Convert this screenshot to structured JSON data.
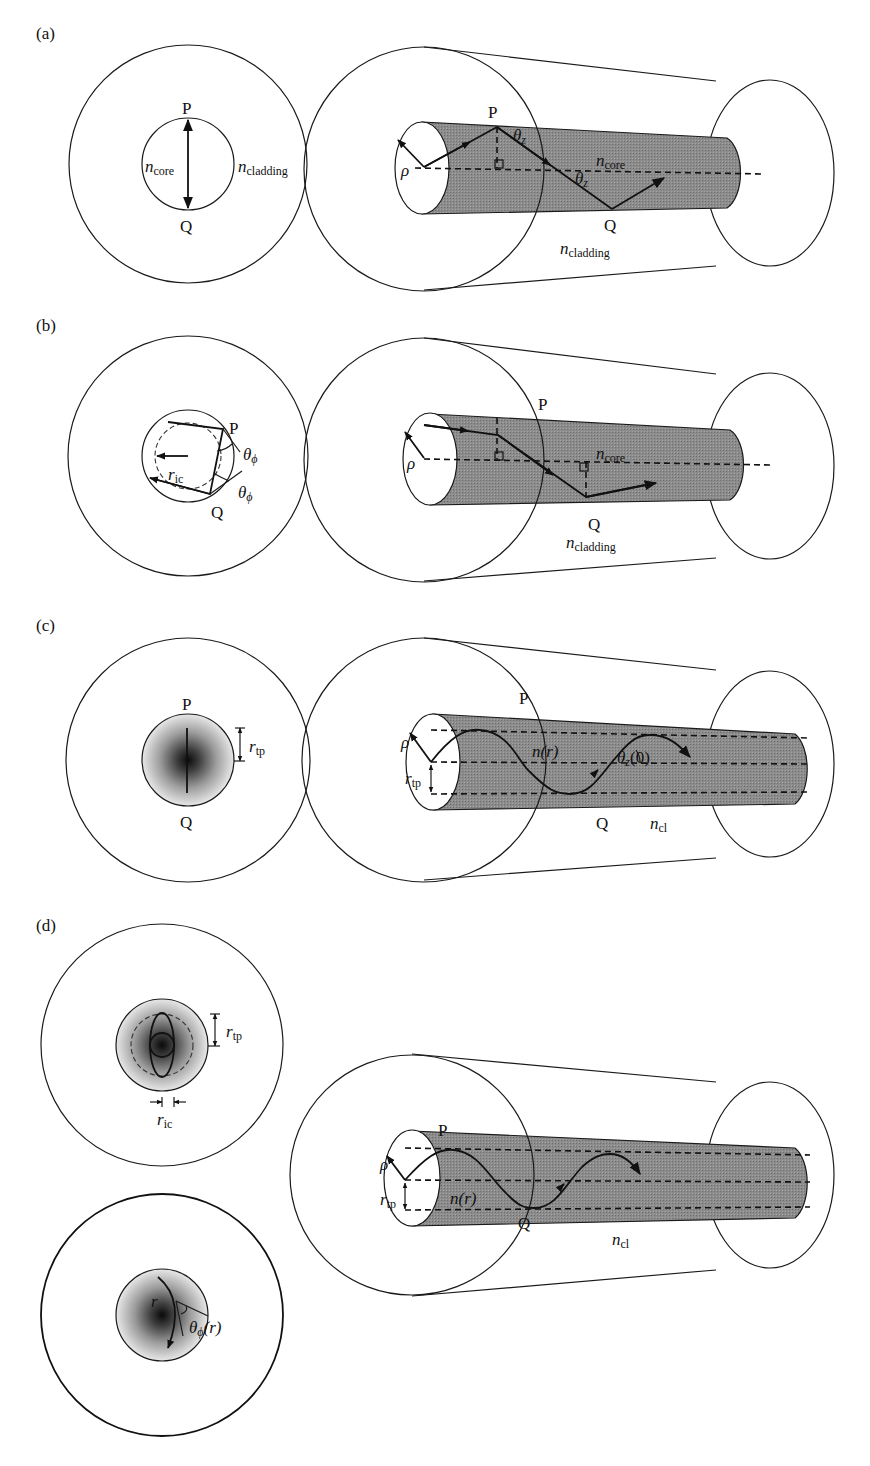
{
  "figure": {
    "panels": [
      {
        "id": "a",
        "label": "(a)",
        "cross_section": {
          "point_top": "P",
          "point_bottom": "Q",
          "core_index": {
            "symbol": "n",
            "sub": "core"
          },
          "cladding_index": {
            "symbol": "n",
            "sub": "cladding"
          }
        },
        "fiber_3d": {
          "radius_symbol": "ρ",
          "point_top": "P",
          "point_bottom": "Q",
          "angle_top": {
            "symbol": "θ",
            "sub": "z"
          },
          "angle_mid": {
            "symbol": "θ",
            "sub": "z"
          },
          "core_index": {
            "symbol": "n",
            "sub": "core"
          },
          "cladding_index": {
            "symbol": "n",
            "sub": "cladding"
          }
        }
      },
      {
        "id": "b",
        "label": "(b)",
        "cross_section": {
          "point_top": "P",
          "point_bottom": "Q",
          "inner_caustic_radius": {
            "symbol": "r",
            "sub": "ic"
          },
          "angle_1": {
            "symbol": "θ",
            "sub": "ϕ"
          },
          "angle_2": {
            "symbol": "θ",
            "sub": "ϕ"
          }
        },
        "fiber_3d": {
          "radius_symbol": "ρ",
          "point_top": "P",
          "point_bottom": "Q",
          "core_index": {
            "symbol": "n",
            "sub": "core"
          },
          "cladding_index": {
            "symbol": "n",
            "sub": "cladding"
          }
        }
      },
      {
        "id": "c",
        "label": "(c)",
        "cross_section": {
          "point_top": "P",
          "point_bottom": "Q",
          "turning_point_radius": {
            "symbol": "r",
            "sub": "tp"
          }
        },
        "fiber_3d": {
          "radius_symbol": "ρ",
          "turning_point_radius": {
            "symbol": "r",
            "sub": "tp"
          },
          "point_top": "P",
          "point_bottom": "Q",
          "profile": "n(r)",
          "angle": {
            "symbol": "θ",
            "sub": "z",
            "arg": "(0)"
          },
          "cladding_index": {
            "symbol": "n",
            "sub": "cl"
          }
        }
      },
      {
        "id": "d",
        "label": "(d)",
        "cross_section_top": {
          "turning_point_radius": {
            "symbol": "r",
            "sub": "tp"
          },
          "inner_caustic_radius": {
            "symbol": "r",
            "sub": "ic"
          }
        },
        "cross_section_bottom": {
          "radius": "r",
          "angle": {
            "symbol": "θ",
            "sub": "ϕ",
            "arg": "(r)"
          }
        },
        "fiber_3d": {
          "radius_symbol": "ρ",
          "turning_point_radius": {
            "symbol": "r",
            "sub": "tp"
          },
          "point_top": "P",
          "point_bottom": "Q",
          "profile": "n(r)",
          "cladding_index": {
            "symbol": "n",
            "sub": "cl"
          }
        }
      }
    ],
    "colors": {
      "line": "#1a1a1a",
      "core_fill": "#8a8a8a",
      "background": "#ffffff"
    }
  }
}
